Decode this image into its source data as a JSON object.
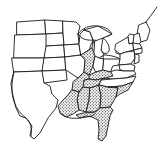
{
  "figure": {
    "title": "Map of the eastern United States",
    "width": 161,
    "height": 159,
    "background_color": "#ffffff",
    "line_color": "#1a1a1a",
    "shading_color": "#6e6e6e",
    "shading_style": "stipple-dot-pattern"
  },
  "legend": {
    "shaded_meaning": "highlighted region",
    "unshaded_meaning": "remaining states"
  },
  "regions": {
    "shaded": [
      "Illinois",
      "Kentucky",
      "Tennessee",
      "Arkansas",
      "Louisiana",
      "Mississippi",
      "Alabama",
      "Georgia",
      "South Carolina",
      "Florida"
    ],
    "unshaded": [
      "Montana",
      "North Dakota",
      "South Dakota",
      "Nebraska",
      "Kansas",
      "Oklahoma",
      "Texas",
      "Minnesota",
      "Iowa",
      "Missouri",
      "Wisconsin",
      "Michigan",
      "Indiana",
      "Ohio",
      "West Virginia",
      "Virginia",
      "North Carolina",
      "Pennsylvania",
      "New York",
      "Maine",
      "Vermont",
      "New Hampshire",
      "Massachusetts",
      "Connecticut",
      "Rhode Island",
      "New Jersey",
      "Delaware",
      "Maryland"
    ],
    "water_features": [
      "Lake Superior",
      "Lake Michigan",
      "Lake Huron",
      "Lake Erie",
      "Lake Ontario",
      "Atlantic Ocean",
      "Gulf of Mexico"
    ]
  }
}
